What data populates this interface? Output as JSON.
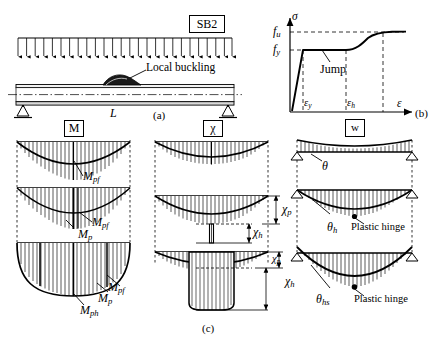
{
  "figure": {
    "specimen_label": "SB2",
    "captions": {
      "a": "(a)",
      "b": "(b)",
      "c": "(c)"
    },
    "beam": {
      "span_label": "L",
      "local_buckling_label": "Local buckling",
      "load_label": "w",
      "load_arrow_count": 25,
      "support_type": "pinned-roller"
    },
    "stress_strain": {
      "y_axis_label": "σ",
      "x_axis_label": "ε",
      "y_ticks": [
        "f",
        "f"
      ],
      "y_tick_u": "u",
      "y_tick_y": "y",
      "f_u_label": "f",
      "f_u_sub": "u",
      "f_y_label": "f",
      "f_y_sub": "y",
      "eps_y_label": "ε",
      "eps_y_sub": "y",
      "eps_h_label": "ε",
      "eps_h_sub": "h",
      "annotation": "Jump",
      "type": "line",
      "description": "elastic-perfectly-plastic with strain hardening"
    },
    "columns": [
      {
        "key": "moment",
        "header": "M"
      },
      {
        "key": "curvature",
        "header": "χ"
      },
      {
        "key": "deflection",
        "header": "w"
      }
    ],
    "moment_column": {
      "rows": [
        {
          "labels": [
            {
              "base": "M",
              "sub": "pf"
            }
          ]
        },
        {
          "labels": [
            {
              "base": "M",
              "sub": "pf"
            },
            {
              "base": "M",
              "sub": "p"
            }
          ]
        },
        {
          "labels": [
            {
              "base": "M",
              "sub": "pf"
            },
            {
              "base": "M",
              "sub": "p"
            },
            {
              "base": "M",
              "sub": "ph"
            }
          ]
        }
      ]
    },
    "curvature_column": {
      "rows": [
        {
          "dims": []
        },
        {
          "dims": [
            {
              "base": "χ",
              "sub": "p"
            },
            {
              "base": "χ",
              "sub": "h"
            }
          ]
        },
        {
          "dims": [
            {
              "base": "χ",
              "sub": "p"
            },
            {
              "base": "χ",
              "sub": "h"
            }
          ]
        }
      ]
    },
    "deflection_column": {
      "rows": [
        {
          "angle": {
            "base": "θ",
            "sub": ""
          },
          "hinge": ""
        },
        {
          "angle": {
            "base": "θ",
            "sub": "h"
          },
          "hinge": "Plastic hinge"
        },
        {
          "angle": {
            "base": "θ",
            "sub": "hs"
          },
          "hinge": "Plastic hinge"
        }
      ]
    },
    "colors": {
      "line": "#000000",
      "dashed": "#000000",
      "fill": "#ffffff"
    }
  }
}
